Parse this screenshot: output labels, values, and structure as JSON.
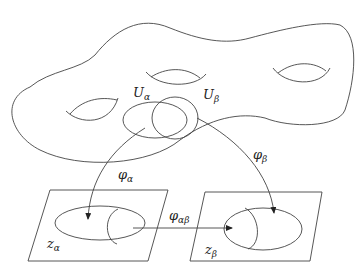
{
  "diagram": {
    "type": "manifold-coordinate-charts",
    "labels": {
      "U_alpha": {
        "base": "U",
        "sub": "α"
      },
      "U_beta": {
        "base": "U",
        "sub": "β"
      },
      "phi_alpha": {
        "base": "φ",
        "sub": "α"
      },
      "phi_beta": {
        "base": "φ",
        "sub": "β"
      },
      "phi_alphabeta": {
        "base": "φ",
        "sub": "αβ"
      },
      "z_alpha": {
        "base": "z",
        "sub": "α"
      },
      "z_beta": {
        "base": "z",
        "sub": "β"
      }
    },
    "colors": {
      "stroke": "#333333",
      "background": "#ffffff"
    }
  }
}
